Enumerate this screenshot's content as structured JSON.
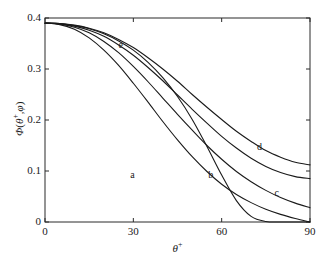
{
  "figure": {
    "background_color": "#ffffff",
    "axis_color": "#2b2b2b",
    "curve_color": "#1a1a1a"
  },
  "axes": {
    "xlabel": "θ⁺",
    "ylabel": "Φ(θ⁺,φ)",
    "xlabel_base": "θ",
    "xlabel_sup": "+",
    "ylabel_text": "Φ(θ⁺,φ)",
    "xticks": [
      "0",
      "30",
      "60",
      "90"
    ],
    "yticks": [
      "0",
      "0.1",
      "0.2",
      "0.3",
      "0.4"
    ]
  },
  "curve_labels": {
    "a": "a",
    "b": "b",
    "c": "c",
    "d": "d",
    "e": "e"
  },
  "chart_data": {
    "type": "line",
    "title": "",
    "xlabel": "θ⁺",
    "ylabel": "Φ(θ⁺,φ)",
    "xlim": [
      0,
      90
    ],
    "ylim": [
      0,
      0.4
    ],
    "xticks": [
      0,
      30,
      60,
      90
    ],
    "yticks": [
      0,
      0.1,
      0.2,
      0.3,
      0.4
    ],
    "grid": false,
    "legend_position": "inline-annotations",
    "x": [
      0,
      5,
      10,
      15,
      20,
      25,
      30,
      35,
      40,
      45,
      50,
      55,
      60,
      65,
      70,
      75,
      80,
      85,
      90
    ],
    "series": [
      {
        "name": "a",
        "label": "a",
        "label_position": {
          "x": 30,
          "y": 0.093
        },
        "values": [
          0.39,
          0.387,
          0.378,
          0.361,
          0.337,
          0.307,
          0.272,
          0.235,
          0.197,
          0.161,
          0.128,
          0.099,
          0.074,
          0.054,
          0.038,
          0.025,
          0.015,
          0.007,
          0.0
        ]
      },
      {
        "name": "b",
        "label": "b",
        "label_position": {
          "x": 56.5,
          "y": 0.093
        },
        "values": [
          0.39,
          0.388,
          0.382,
          0.371,
          0.354,
          0.332,
          0.305,
          0.275,
          0.243,
          0.211,
          0.18,
          0.15,
          0.123,
          0.099,
          0.079,
          0.062,
          0.048,
          0.037,
          0.028
        ]
      },
      {
        "name": "c",
        "label": "c",
        "label_position": {
          "x": 79,
          "y": 0.057
        },
        "values": [
          0.39,
          0.389,
          0.384,
          0.376,
          0.364,
          0.347,
          0.327,
          0.303,
          0.277,
          0.249,
          0.221,
          0.194,
          0.168,
          0.145,
          0.125,
          0.109,
          0.097,
          0.089,
          0.085
        ]
      },
      {
        "name": "d",
        "label": "d",
        "label_position": {
          "x": 73,
          "y": 0.148
        },
        "values": [
          0.39,
          0.389,
          0.386,
          0.38,
          0.371,
          0.358,
          0.342,
          0.322,
          0.3,
          0.276,
          0.25,
          0.225,
          0.201,
          0.178,
          0.158,
          0.14,
          0.127,
          0.117,
          0.112
        ]
      },
      {
        "name": "e",
        "label": "e",
        "label_position": {
          "x": 26,
          "y": 0.348
        },
        "values": [
          0.39,
          0.389,
          0.385,
          0.379,
          0.369,
          0.355,
          0.337,
          0.313,
          0.283,
          0.246,
          0.201,
          0.148,
          0.092,
          0.042,
          0.011,
          0.001,
          0.0,
          0.0,
          0.0
        ]
      }
    ]
  },
  "geometry": {
    "plot_left": 45,
    "plot_right": 310,
    "plot_top": 18,
    "plot_bottom": 222
  }
}
